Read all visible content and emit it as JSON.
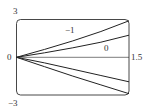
{
  "chart_data": {
    "type": "line",
    "title": "",
    "xlabel": "",
    "ylabel": "",
    "xlim": [
      0,
      1.5
    ],
    "ylim": [
      -3,
      3
    ],
    "grid": false,
    "tick_labels": {
      "y_top": "3",
      "y_bottom": "−3",
      "x_left": "0",
      "x_right": "1.5"
    },
    "annotations": [
      "−1",
      "0"
    ],
    "series": [
      {
        "name": "−1",
        "x": [
          0,
          0.375,
          0.75,
          1.125,
          1.5
        ],
        "y": [
          0,
          0.62,
          1.3,
          2.05,
          2.9
        ]
      },
      {
        "name": "0",
        "x": [
          0,
          0.375,
          0.75,
          1.125,
          1.5
        ],
        "y": [
          0,
          0.35,
          0.75,
          1.2,
          1.75
        ]
      },
      {
        "name": "axis",
        "x": [
          0,
          1.5
        ],
        "y": [
          0,
          0
        ]
      },
      {
        "name": "c3",
        "x": [
          0,
          0.375,
          0.75,
          1.125,
          1.5
        ],
        "y": [
          0,
          -0.45,
          -0.95,
          -1.45,
          -1.95
        ]
      },
      {
        "name": "c4",
        "x": [
          0,
          0.375,
          0.75,
          1.125,
          1.5
        ],
        "y": [
          0,
          -0.75,
          -1.5,
          -2.2,
          -2.9
        ]
      }
    ]
  }
}
